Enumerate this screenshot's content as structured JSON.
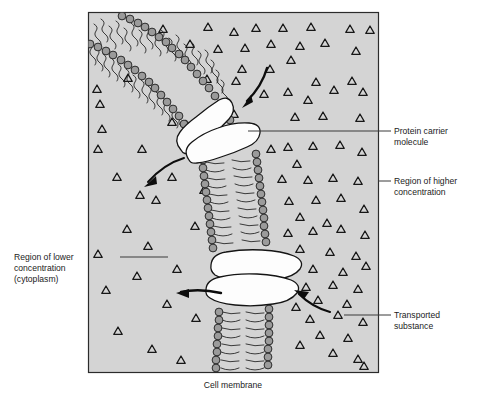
{
  "figure": {
    "title_caption": "Cell membrane",
    "background_color": "#d4d4d4",
    "frame_color": "#2b2b2b",
    "page_background": "#ffffff"
  },
  "labels": {
    "protein_carrier": {
      "line1": "Protein carrier",
      "line2": "molecule",
      "position": "right"
    },
    "higher_concentration": {
      "line1": "Region of higher",
      "line2": "concentration",
      "position": "right"
    },
    "transported_substance": {
      "line1": "Transported",
      "line2": "substance",
      "position": "right"
    },
    "lower_concentration": {
      "line1": "Region of lower",
      "line2": "concentration",
      "line3": "(cytoplasm)",
      "position": "left"
    },
    "cell_membrane": {
      "line1": "Cell membrane",
      "position": "bottom"
    }
  },
  "diagram_elements": {
    "membrane_type": "phospholipid-bilayer",
    "lipid_head_color": "#9b9b9b",
    "lipid_tail_color": "#1d1d1d",
    "carrier_fill_color": "#fdfdfd",
    "solute_marker": "triangle",
    "solute_outline_color": "#161616",
    "carrier_count": 2,
    "arrow_count": 4,
    "arrows": [
      {
        "name": "solute-entering-upper-carrier",
        "direction": "down-left"
      },
      {
        "name": "solute-released-upper-carrier",
        "direction": "down-left"
      },
      {
        "name": "solute-released-lower-carrier",
        "direction": "left"
      },
      {
        "name": "solute-entering-lower-carrier",
        "direction": "up-left"
      }
    ]
  }
}
